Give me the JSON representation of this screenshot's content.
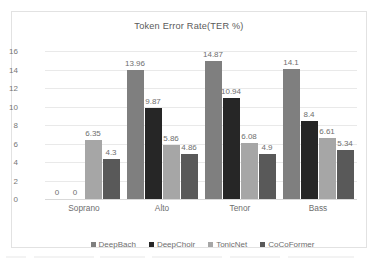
{
  "chart_data": {
    "type": "bar",
    "title": "Token Error Rate(TER %)",
    "xlabel": "",
    "ylabel": "",
    "ylim": [
      0,
      16
    ],
    "ytick_step": 2,
    "yticks": [
      "16",
      "14",
      "12",
      "10",
      "8",
      "6",
      "4",
      "2",
      "0"
    ],
    "grid": true,
    "legend_position": "bottom",
    "categories": [
      "Soprano",
      "Alto",
      "Tenor",
      "Bass"
    ],
    "series": [
      {
        "name": "DeepBach",
        "color": "#7f7f7f",
        "values": [
          0,
          13.96,
          14.87,
          14.1
        ]
      },
      {
        "name": "DeepChoir",
        "color": "#262626",
        "values": [
          0,
          9.87,
          10.94,
          8.4
        ]
      },
      {
        "name": "TonicNet",
        "color": "#a6a6a6",
        "values": [
          6.35,
          5.86,
          6.08,
          6.61
        ]
      },
      {
        "name": "CoCoFormer",
        "color": "#595959",
        "values": [
          4.3,
          4.86,
          4.9,
          5.34
        ]
      }
    ],
    "data_labels": [
      [
        "0",
        "13.96",
        "14.87",
        "14.1"
      ],
      [
        "0",
        "9.87",
        "10.94",
        "8.4"
      ],
      [
        "6.35",
        "5.86",
        "6.08",
        "6.61"
      ],
      [
        "4.3",
        "4.86",
        "4.9",
        "5.34"
      ]
    ]
  },
  "colors": {
    "frame_border": "#e2e2e2",
    "gridline": "#e9e9e9",
    "axis_text": "#6e6e6e",
    "title_text": "#5a5a5a",
    "background": "#ffffff"
  }
}
